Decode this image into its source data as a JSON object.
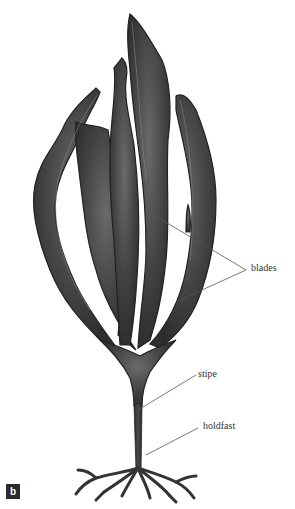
{
  "figure": {
    "panel_label": "b",
    "labels": {
      "blades": "blades",
      "stipe": "stipe",
      "holdfast": "holdfast"
    },
    "colors": {
      "thallus": "#3a3a3a",
      "thallus_highlight": "#6e6e6e",
      "leader_line": "#555555",
      "background": "#ffffff"
    }
  }
}
